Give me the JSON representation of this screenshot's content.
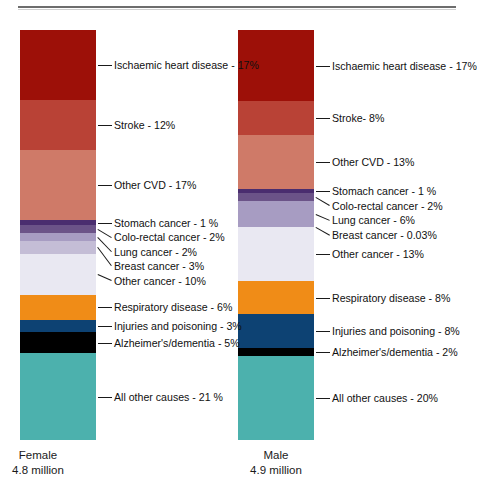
{
  "chart_data": {
    "type": "bar",
    "title": "",
    "subtitle": "",
    "xlabel": "",
    "ylabel": "",
    "ylim": [
      0,
      100
    ],
    "grid": false,
    "legend_position": "none",
    "stacked": true,
    "categories": [
      "Female",
      "Male"
    ],
    "category_sublabels": [
      "4.8 million",
      "4.9 million"
    ],
    "series": [
      {
        "name": "Ischaemic heart disease",
        "color": "#9d1008",
        "values": [
          17,
          17
        ],
        "labels": [
          "Ischaemic heart disease - 17%",
          "Ischaemic heart disease - 17%"
        ]
      },
      {
        "name": "Stroke",
        "color": "#b94236",
        "values": [
          12,
          8
        ],
        "labels": [
          "Stroke - 12%",
          "Stroke- 8%"
        ]
      },
      {
        "name": "Other CVD",
        "color": "#cf7a68",
        "values": [
          17,
          13
        ],
        "labels": [
          "Other CVD - 17%",
          "Other CVD - 13%"
        ]
      },
      {
        "name": "Stomach cancer",
        "color": "#4a2d6f",
        "values": [
          1,
          1
        ],
        "labels": [
          "Stomach cancer - 1 %",
          "Stomach cancer - 1 %"
        ]
      },
      {
        "name": "Colo-rectal cancer",
        "color": "#6b5388",
        "values": [
          2,
          2
        ],
        "labels": [
          "Colo-rectal cancer - 2%",
          "Colo-rectal cancer - 2%"
        ]
      },
      {
        "name": "Lung cancer",
        "color": "#a79cc2",
        "values": [
          2,
          6
        ],
        "labels": [
          "Lung cancer - 2%",
          "Lung cancer - 6%"
        ]
      },
      {
        "name": "Breast cancer",
        "color": "#c4bdd6",
        "values": [
          3,
          0.03
        ],
        "labels": [
          "Breast cancer - 3%",
          "Breast cancer - 0.03%"
        ]
      },
      {
        "name": "Other cancer",
        "color": "#e9e8f2",
        "values": [
          10,
          13
        ],
        "labels": [
          "Other cancer - 10%",
          "Other cancer - 13%"
        ]
      },
      {
        "name": "Respiratory disease",
        "color": "#f08c17",
        "values": [
          6,
          8
        ],
        "labels": [
          "Respiratory disease - 6%",
          "Respiratory disease - 8%"
        ]
      },
      {
        "name": "Injuries and poisoning",
        "color": "#0d4273",
        "values": [
          3,
          8
        ],
        "labels": [
          "Injuries and poisoning - 3%",
          "Injuries and poisoning - 8%"
        ]
      },
      {
        "name": "Alzheimer's/dementia",
        "color": "#000000",
        "values": [
          5,
          2
        ],
        "labels": [
          "Alzheimer's/dementia - 5%",
          "Alzheimer's/dementia - 2%"
        ]
      },
      {
        "name": "All other causes",
        "color": "#4cb1ad",
        "values": [
          21,
          20
        ],
        "labels": [
          "All other causes - 21 %",
          "All other causes - 20%"
        ]
      }
    ]
  },
  "female": {
    "axis_label": "Female",
    "axis_sublabel": "4.8 million",
    "callouts": [
      "Ischaemic heart disease - 17%",
      "Stroke - 12%",
      "Other CVD - 17%",
      "Stomach cancer - 1 %",
      "Colo-rectal cancer - 2%",
      "Lung cancer - 2%",
      "Breast cancer - 3%",
      "Other cancer - 10%",
      "Respiratory disease - 6%",
      "Injuries and poisoning - 3%",
      "Alzheimer's/dementia - 5%",
      "All other causes - 21 %"
    ]
  },
  "male": {
    "axis_label": "Male",
    "axis_sublabel": "4.9 million",
    "callouts": [
      "Ischaemic heart disease - 17%",
      "Stroke- 8%",
      "Other CVD - 13%",
      "Stomach cancer - 1 %",
      "Colo-rectal cancer - 2%",
      "Lung cancer - 6%",
      "Breast cancer - 0.03%",
      "Other cancer - 13%",
      "Respiratory disease - 8%",
      "Injuries and poisoning - 8%",
      "Alzheimer's/dementia - 2%",
      "All other causes - 20%"
    ]
  }
}
